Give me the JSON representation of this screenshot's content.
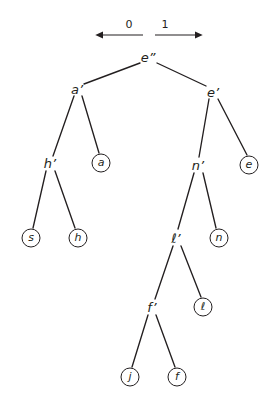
{
  "diagram": {
    "type": "binary-tree",
    "branch_labels": {
      "left": "0",
      "right": "1",
      "left_arrow_icon": "arrow-left-icon",
      "right_arrow_icon": "arrow-right-icon"
    },
    "colors": {
      "ink": "#231f20",
      "background": "#ffffff"
    },
    "nodes": [
      {
        "id": "root",
        "label": "e”",
        "kind": "internal",
        "x": 148,
        "y": 57
      },
      {
        "id": "a1",
        "label": "a’",
        "kind": "internal",
        "x": 77,
        "y": 89
      },
      {
        "id": "e1",
        "label": "e’",
        "kind": "internal",
        "x": 213,
        "y": 92
      },
      {
        "id": "h1",
        "label": "h’",
        "kind": "internal",
        "x": 50,
        "y": 163
      },
      {
        "id": "leaf_a",
        "label": "a",
        "kind": "leaf",
        "x": 101,
        "y": 163
      },
      {
        "id": "n1",
        "label": "n’",
        "kind": "internal",
        "x": 198,
        "y": 165
      },
      {
        "id": "leaf_e",
        "label": "e",
        "kind": "leaf",
        "x": 249,
        "y": 165
      },
      {
        "id": "leaf_s",
        "label": "s",
        "kind": "leaf",
        "x": 31,
        "y": 238
      },
      {
        "id": "leaf_h",
        "label": "h",
        "kind": "leaf",
        "x": 78,
        "y": 238
      },
      {
        "id": "l1",
        "label": "ℓ’",
        "kind": "internal",
        "x": 176,
        "y": 238
      },
      {
        "id": "leaf_n",
        "label": "n",
        "kind": "leaf",
        "x": 219,
        "y": 238
      },
      {
        "id": "f1",
        "label": "f’",
        "kind": "internal",
        "x": 152,
        "y": 307
      },
      {
        "id": "leaf_l",
        "label": "ℓ",
        "kind": "leaf",
        "x": 203,
        "y": 307
      },
      {
        "id": "leaf_j",
        "label": "j",
        "kind": "leaf",
        "x": 130,
        "y": 377
      },
      {
        "id": "leaf_f",
        "label": "f",
        "kind": "leaf",
        "x": 177,
        "y": 377
      }
    ],
    "edges": [
      {
        "from": "root",
        "to": "a1",
        "bit": "0",
        "x1": 140,
        "y1": 63,
        "x2": 84,
        "y2": 84
      },
      {
        "from": "root",
        "to": "e1",
        "bit": "1",
        "x1": 157,
        "y1": 63,
        "x2": 206,
        "y2": 86
      },
      {
        "from": "a1",
        "to": "h1",
        "bit": "0",
        "x1": 74,
        "y1": 96,
        "x2": 53,
        "y2": 156
      },
      {
        "from": "a1",
        "to": "leaf_a",
        "bit": "1",
        "x1": 82,
        "y1": 96,
        "x2": 99,
        "y2": 153
      },
      {
        "from": "e1",
        "to": "n1",
        "bit": "0",
        "x1": 209,
        "y1": 99,
        "x2": 199,
        "y2": 157
      },
      {
        "from": "e1",
        "to": "leaf_e",
        "bit": "1",
        "x1": 218,
        "y1": 99,
        "x2": 247,
        "y2": 155
      },
      {
        "from": "h1",
        "to": "leaf_s",
        "bit": "0",
        "x1": 46,
        "y1": 171,
        "x2": 33,
        "y2": 228
      },
      {
        "from": "h1",
        "to": "leaf_h",
        "bit": "1",
        "x1": 55,
        "y1": 171,
        "x2": 75,
        "y2": 228
      },
      {
        "from": "n1",
        "to": "l1",
        "bit": "0",
        "x1": 194,
        "y1": 173,
        "x2": 178,
        "y2": 229
      },
      {
        "from": "n1",
        "to": "leaf_n",
        "bit": "1",
        "x1": 203,
        "y1": 173,
        "x2": 216,
        "y2": 228
      },
      {
        "from": "l1",
        "to": "f1",
        "bit": "0",
        "x1": 173,
        "y1": 246,
        "x2": 155,
        "y2": 299
      },
      {
        "from": "l1",
        "to": "leaf_l",
        "bit": "1",
        "x1": 181,
        "y1": 246,
        "x2": 201,
        "y2": 297
      },
      {
        "from": "f1",
        "to": "leaf_j",
        "bit": "0",
        "x1": 148,
        "y1": 315,
        "x2": 132,
        "y2": 367
      },
      {
        "from": "f1",
        "to": "leaf_f",
        "bit": "1",
        "x1": 156,
        "y1": 315,
        "x2": 175,
        "y2": 367
      }
    ],
    "arrows": {
      "left": {
        "label": "0",
        "label_x": 129,
        "label_y": 24,
        "line_x1": 102,
        "line_x2": 143,
        "line_y": 35
      },
      "right": {
        "label": "1",
        "label_x": 165,
        "label_y": 24,
        "line_x1": 155,
        "line_x2": 196,
        "line_y": 35
      }
    }
  }
}
